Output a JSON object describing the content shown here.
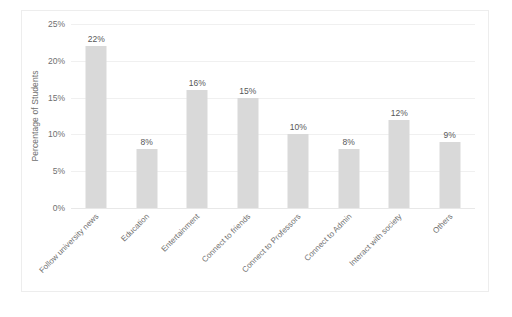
{
  "chart_data": {
    "type": "bar",
    "title": "",
    "xlabel": "",
    "ylabel": "Percentage of Students",
    "ylim": [
      0,
      25
    ],
    "ytick_labels": [
      "0%",
      "5%",
      "10%",
      "15%",
      "20%",
      "25%"
    ],
    "ytick_values": [
      0,
      5,
      10,
      15,
      20,
      25
    ],
    "grid": true,
    "legend": "none",
    "bar_color": "#d9d9d9",
    "categories": [
      "Follow university news",
      "Education",
      "Entertainment",
      "Connect to friends",
      "Connect to Professors",
      "Connect to Admin",
      "Interact with society",
      "Others"
    ],
    "values": [
      22,
      8,
      16,
      15,
      10,
      8,
      12,
      9
    ],
    "data_labels": [
      "22%",
      "8%",
      "16%",
      "15%",
      "10%",
      "8%",
      "12%",
      "9%"
    ]
  }
}
